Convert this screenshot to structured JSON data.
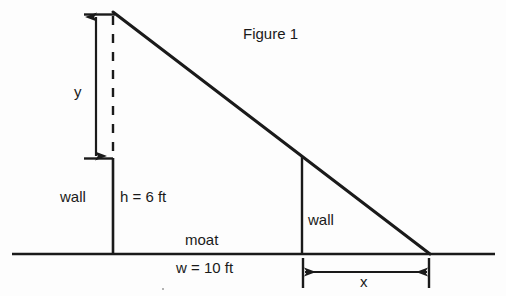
{
  "figure": {
    "title": "Figure 1",
    "background_color": "#fdfdfd",
    "ink_color": "#1a1a1a"
  },
  "labels": {
    "y": "y",
    "wall_left": "wall",
    "height": "h = 6 ft",
    "moat": "moat",
    "width": "w = 10 ft",
    "wall_right": "wall",
    "x": "x"
  },
  "chart_data": {
    "type": "diagram",
    "title": "Figure 1",
    "known_values": [
      {
        "symbol": "h",
        "label": "h = 6 ft",
        "value": 6,
        "unit": "ft",
        "meaning": "height of left wall"
      },
      {
        "symbol": "w",
        "label": "w = 10 ft",
        "value": 10,
        "unit": "ft",
        "meaning": "width of moat"
      }
    ],
    "unknown_values": [
      {
        "symbol": "y",
        "label": "y",
        "meaning": "vertical distance above the left wall top to the plank's upper end"
      },
      {
        "symbol": "x",
        "label": "x",
        "meaning": "horizontal distance from the right wall to where the plank meets the ground"
      }
    ],
    "geometry": {
      "ground_line": {
        "x1": 12,
        "y1": 254,
        "x2": 495,
        "y2": 254
      },
      "hypotenuse": {
        "x1": 113,
        "y1": 12,
        "x2": 430,
        "y2": 254
      },
      "left_wall": {
        "x": 113,
        "y_top": 158,
        "y_bottom": 254
      },
      "right_wall": {
        "x": 302,
        "y_top": 157,
        "y_bottom": 254
      },
      "dashed_vertical": {
        "x": 113,
        "y_top": 16,
        "y_bottom": 158
      },
      "y_dimension_arrow": {
        "x": 96,
        "y_top": 14,
        "y_bottom": 158
      },
      "x_dimension_arrow": {
        "y": 272,
        "x_left": 302,
        "x_right": 428
      }
    }
  }
}
